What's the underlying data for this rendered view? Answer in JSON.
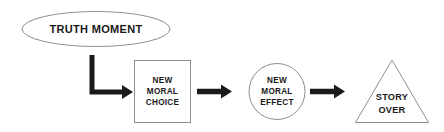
{
  "diagram": {
    "type": "flowchart",
    "orientation": "left-to-right",
    "background_color": "#ffffff",
    "outline_color": "#8d8d8d",
    "arrow_color": "#1a1a1a",
    "text_color": "#1a1a1a",
    "nodes": [
      {
        "id": "truth-moment",
        "shape": "ellipse",
        "label": "TRUTH MOMENT",
        "lines": [
          "TRUTH MOMENT"
        ]
      },
      {
        "id": "new-moral-choice",
        "shape": "rectangle",
        "label": "NEW MORAL CHOICE",
        "lines": [
          "NEW",
          "MORAL",
          "CHOICE"
        ]
      },
      {
        "id": "new-moral-effect",
        "shape": "circle",
        "label": "NEW MORAL EFFECT",
        "lines": [
          "NEW",
          "MORAL",
          "EFFECT"
        ]
      },
      {
        "id": "story-over",
        "shape": "triangle",
        "label": "STORY OVER",
        "lines": [
          "STORY",
          "OVER"
        ]
      }
    ],
    "connectors": [
      {
        "id": "elbow-arrow",
        "style": "elbow-down-right",
        "from": "truth-moment",
        "to": "new-moral-choice"
      },
      {
        "id": "arrow-choice-to-effect",
        "style": "straight-right",
        "from": "new-moral-choice",
        "to": "new-moral-effect"
      },
      {
        "id": "arrow-effect-to-story",
        "style": "straight-right",
        "from": "new-moral-effect",
        "to": "story-over"
      }
    ]
  }
}
